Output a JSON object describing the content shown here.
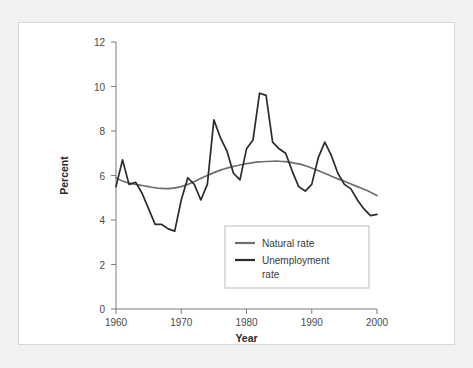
{
  "figure": {
    "panel_background": "#ffffff",
    "page_background": "#f1f1f1",
    "border_color": "#d8d8d8"
  },
  "chart_data": {
    "type": "line",
    "title": "",
    "xlabel": "Year",
    "ylabel": "Percent",
    "xlim": [
      1960,
      2000
    ],
    "ylim": [
      0,
      12
    ],
    "xticks": [
      1960,
      1970,
      1980,
      1990,
      2000
    ],
    "yticks": [
      0,
      2,
      4,
      6,
      8,
      10,
      12
    ],
    "xtick_labels": [
      "1960",
      "1970",
      "1980",
      "1990",
      "2000"
    ],
    "ytick_labels": [
      "0",
      "2",
      "4",
      "6",
      "8",
      "10",
      "12"
    ],
    "grid": false,
    "legend_position": "center-bottom-right",
    "x": [
      1960,
      1961,
      1962,
      1963,
      1964,
      1965,
      1966,
      1967,
      1968,
      1969,
      1970,
      1971,
      1972,
      1973,
      1974,
      1975,
      1976,
      1977,
      1978,
      1979,
      1980,
      1981,
      1982,
      1983,
      1984,
      1985,
      1986,
      1987,
      1988,
      1989,
      1990,
      1991,
      1992,
      1993,
      1994,
      1995,
      1996,
      1997,
      1998,
      1999,
      2000
    ],
    "series": [
      {
        "name": "Natural rate",
        "color": "#6e6e6e",
        "values": [
          5.9,
          5.75,
          5.66,
          5.6,
          5.55,
          5.5,
          5.45,
          5.42,
          5.41,
          5.44,
          5.5,
          5.6,
          5.73,
          5.87,
          6.0,
          6.13,
          6.24,
          6.33,
          6.41,
          6.47,
          6.53,
          6.58,
          6.61,
          6.63,
          6.64,
          6.64,
          6.62,
          6.58,
          6.52,
          6.44,
          6.34,
          6.22,
          6.1,
          5.97,
          5.85,
          5.74,
          5.62,
          5.5,
          5.38,
          5.25,
          5.1
        ]
      },
      {
        "name": "Unemployment rate",
        "color": "#2b2b2b",
        "values": [
          5.5,
          6.7,
          5.6,
          5.7,
          5.2,
          4.5,
          3.8,
          3.8,
          3.6,
          3.5,
          4.9,
          5.9,
          5.6,
          4.9,
          5.6,
          8.5,
          7.7,
          7.1,
          6.1,
          5.8,
          7.2,
          7.6,
          9.7,
          9.6,
          7.5,
          7.2,
          7.0,
          6.2,
          5.5,
          5.3,
          5.6,
          6.8,
          7.5,
          6.9,
          6.1,
          5.6,
          5.4,
          4.9,
          4.5,
          4.2,
          4.25
        ]
      }
    ],
    "legend_entries": [
      {
        "label": "Natural rate",
        "color": "#6e6e6e"
      },
      {
        "label": "Unemployment rate",
        "color": "#2b2b2b"
      }
    ]
  },
  "legend": {
    "entry_one_label": "Natural rate",
    "entry_two_line_one": "Unemployment",
    "entry_two_line_two": "rate"
  }
}
